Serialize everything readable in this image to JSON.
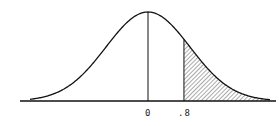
{
  "diagram": {
    "type": "normal-distribution-curve",
    "mean_label": "0",
    "cutoff_label": ".8",
    "shaded_region": "right tail (z > .8)",
    "colors": {
      "stroke": "#111111",
      "hatch": "#555555",
      "background": "#ffffff"
    }
  },
  "chart_data": {
    "type": "area",
    "title": "",
    "xlabel": "",
    "ylabel": "",
    "tick_labels": [
      "0",
      ".8"
    ],
    "vertical_lines_at": [
      0,
      0.8
    ],
    "shaded_from": 0.8,
    "shaded_to": "infinity",
    "grid": false,
    "legend": null
  }
}
